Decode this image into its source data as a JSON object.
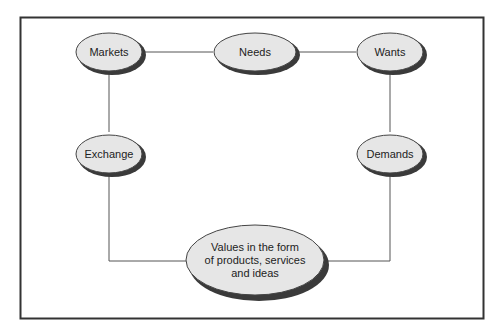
{
  "diagram": {
    "nodes": {
      "markets": {
        "label": "Markets"
      },
      "needs": {
        "label": "Needs"
      },
      "wants": {
        "label": "Wants"
      },
      "exchange": {
        "label": "Exchange"
      },
      "demands": {
        "label": "Demands"
      },
      "values": {
        "lines": [
          "Values in the form",
          "of products, services",
          "and ideas"
        ]
      }
    },
    "edges": [
      [
        "Markets",
        "Needs"
      ],
      [
        "Needs",
        "Wants"
      ],
      [
        "Markets",
        "Exchange"
      ],
      [
        "Wants",
        "Demands"
      ],
      [
        "Exchange",
        "Values in the form of products, services and ideas"
      ],
      [
        "Demands",
        "Values in the form of products, services and ideas"
      ]
    ],
    "colors": {
      "node_fill": "#e6e6e6",
      "node_shadow": "#3a3a3a",
      "line": "#555555",
      "frame": "#333333"
    }
  }
}
